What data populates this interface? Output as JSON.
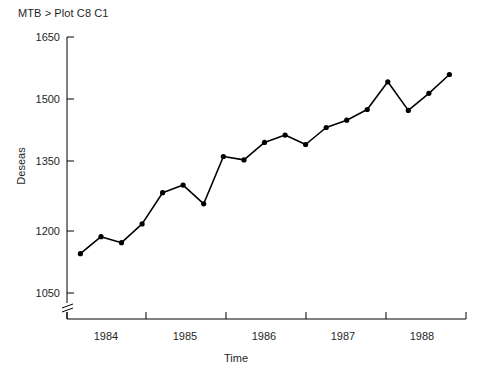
{
  "session": {
    "prompt_line": "MTB > Plot C8 C1"
  },
  "chart_data": {
    "type": "line",
    "title": "",
    "xlabel": "Time",
    "ylabel": "Deseas",
    "xlim": [
      1983.55,
      1988.6
    ],
    "ylim": [
      1050,
      1650
    ],
    "y_axis_break": true,
    "grid": false,
    "legend": "none",
    "marker": "filled-circle",
    "line_color": "#000000",
    "marker_color": "#000000",
    "axis_color": "#000000",
    "background_color": "#ffffff",
    "xticks": [
      1984,
      1985,
      1986,
      1987,
      1988
    ],
    "xtick_labels": [
      "1984",
      "1985",
      "1986",
      "1987",
      "1988"
    ],
    "yticks": [
      1050,
      1200,
      1350,
      1500,
      1650
    ],
    "ytick_labels": [
      "1050",
      "1200",
      "1350",
      "1500",
      "1650"
    ],
    "x": [
      1983.72,
      1983.98,
      1984.24,
      1984.5,
      1984.76,
      1985.02,
      1985.28,
      1985.53,
      1985.79,
      1986.05,
      1986.31,
      1986.57,
      1986.83,
      1987.09,
      1987.35,
      1987.61,
      1987.87,
      1988.13,
      1988.39
    ],
    "values": [
      1142,
      1182,
      1168,
      1212,
      1285,
      1303,
      1259,
      1370,
      1362,
      1403,
      1420,
      1398,
      1438,
      1455,
      1480,
      1545,
      1478,
      1518,
      1562
    ],
    "series": [
      {
        "name": "C8 vs C1",
        "values": [
          1142,
          1182,
          1168,
          1212,
          1285,
          1303,
          1259,
          1370,
          1362,
          1403,
          1420,
          1398,
          1438,
          1455,
          1480,
          1545,
          1478,
          1518,
          1562
        ]
      }
    ]
  }
}
